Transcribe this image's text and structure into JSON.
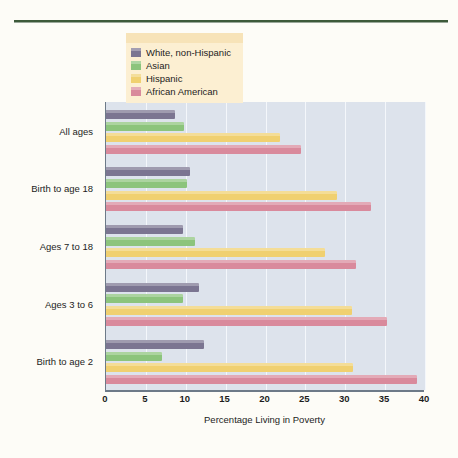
{
  "chart_data": {
    "type": "bar",
    "orientation": "horizontal",
    "title": "",
    "xlabel": "Percentage Living in Poverty",
    "ylabel": "",
    "xlim": [
      0,
      40
    ],
    "xticks": [
      0,
      5,
      10,
      15,
      20,
      25,
      30,
      35,
      40
    ],
    "grid": true,
    "legend_position": "top-left",
    "categories": [
      "All ages",
      "Birth to age 18",
      "Ages 7 to 18",
      "Ages 3 to 6",
      "Birth to age 2"
    ],
    "series": [
      {
        "name": "White, non-Hispanic",
        "color": "#7b7591",
        "values": [
          8.6,
          10.5,
          9.7,
          11.6,
          12.3
        ]
      },
      {
        "name": "Asian",
        "color": "#8cc47c",
        "values": [
          9.8,
          10.2,
          11.2,
          9.6,
          7.0
        ]
      },
      {
        "name": "Hispanic",
        "color": "#f0d070",
        "values": [
          21.8,
          29.0,
          27.4,
          30.8,
          31.0
        ]
      },
      {
        "name": "African American",
        "color": "#d98a9c",
        "values": [
          24.5,
          33.2,
          31.4,
          35.2,
          39.0
        ]
      }
    ]
  },
  "legend": {
    "items": [
      {
        "label": "White, non-Hispanic",
        "color": "#7b7591"
      },
      {
        "label": "Asian",
        "color": "#8cc47c"
      },
      {
        "label": "Hispanic",
        "color": "#f0d070"
      },
      {
        "label": "African American",
        "color": "#d98a9c"
      }
    ]
  },
  "colors": {
    "page_background": "#fdfcf7",
    "plot_background": "#dde3ec",
    "gridline": "#f4f7fb",
    "axis": "#6d7a88",
    "top_rule": "#3d5a3a",
    "legend_background": "#fcefd2",
    "legend_top_strip": "#f7e3b8",
    "text": "#1c1c1c"
  }
}
